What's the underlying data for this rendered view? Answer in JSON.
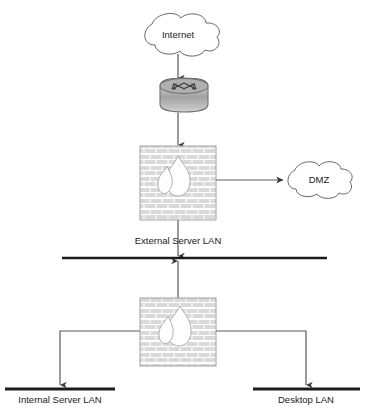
{
  "diagram": {
    "colors": {
      "line": "#5a5a5a",
      "bus": "#1c1c1c",
      "brick": "#d9d9d9",
      "mortar": "#ffffff",
      "brick_border": "#9a9a9a",
      "flame": "#ffffff",
      "router_top": "#9e9e9e",
      "router_bottom": "#c9c9c9",
      "text": "#1a1a1a",
      "cloud_stroke": "#555555",
      "background": "#ffffff"
    },
    "nodes": [
      {
        "id": "internet",
        "type": "cloud",
        "label": "Internet",
        "icon": "cloud-icon",
        "x": 178,
        "y": 34
      },
      {
        "id": "router",
        "type": "router",
        "label": "",
        "icon": "router-icon",
        "x": 184,
        "y": 97
      },
      {
        "id": "firewall-external",
        "type": "firewall",
        "label": "",
        "icon": "firewall-brick-flame-icon",
        "x": 178,
        "y": 183
      },
      {
        "id": "dmz",
        "type": "cloud",
        "label": "DMZ",
        "icon": "cloud-icon",
        "x": 318,
        "y": 180
      },
      {
        "id": "firewall-internal",
        "type": "firewall",
        "label": "",
        "icon": "firewall-brick-flame-icon",
        "x": 178,
        "y": 331
      }
    ],
    "networks": [
      {
        "id": "external-server-lan",
        "label": "External Server LAN",
        "label_x": 178,
        "label_y": 241,
        "bus_y": 258,
        "bus_x1": 62,
        "bus_x2": 327
      },
      {
        "id": "internal-server-lan",
        "label": "Internal Server LAN",
        "label_x": 60,
        "label_y": 404,
        "bus_y": 389,
        "bus_x1": 5,
        "bus_x2": 115
      },
      {
        "id": "desktop-lan",
        "label": "Desktop LAN",
        "label_x": 306,
        "label_y": 404,
        "bus_y": 389,
        "bus_x1": 253,
        "bus_x2": 360
      }
    ],
    "connections": [
      {
        "id": "internet-to-router",
        "from": "internet",
        "to": "router",
        "arrow": "down"
      },
      {
        "id": "router-to-firewall-external",
        "from": "router",
        "to": "firewall-external",
        "arrow": "down"
      },
      {
        "id": "firewall-external-to-dmz",
        "from": "firewall-external",
        "to": "dmz",
        "arrow": "right"
      },
      {
        "id": "firewall-external-to-external-server-lan",
        "from": "firewall-external",
        "to": "external-server-lan",
        "arrow": "down"
      },
      {
        "id": "external-server-lan-to-firewall-internal",
        "from": "external-server-lan",
        "to": "firewall-internal",
        "arrow": "up"
      },
      {
        "id": "firewall-internal-to-internal-server-lan",
        "from": "firewall-internal",
        "to": "internal-server-lan",
        "arrow": "down"
      },
      {
        "id": "firewall-internal-to-desktop-lan",
        "from": "firewall-internal",
        "to": "desktop-lan",
        "arrow": "down"
      }
    ]
  }
}
